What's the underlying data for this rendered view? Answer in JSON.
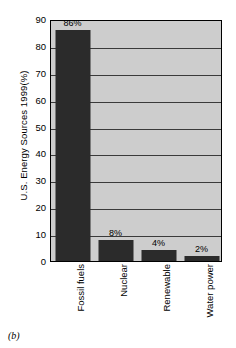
{
  "caption": "(b)",
  "chart_data": {
    "type": "bar",
    "title": "",
    "xlabel": "",
    "ylabel": "U.S. Energy Sources 1999(%)",
    "categories": [
      "Fossil fuels",
      "Nuclear",
      "Renewable",
      "Water power"
    ],
    "values": [
      86,
      8,
      4,
      2
    ],
    "data_labels": [
      "86%",
      "8%",
      "4%",
      "2%"
    ],
    "ylim": [
      0,
      90
    ],
    "yticks": [
      0,
      10,
      20,
      30,
      40,
      50,
      60,
      70,
      80,
      90
    ],
    "ytick_labels": [
      "0",
      "10",
      "20",
      "30",
      "40",
      "50",
      "60",
      "70",
      "80",
      "90"
    ],
    "grid": true,
    "legend": false,
    "colors": {
      "bar": "#2b2b2b",
      "plot_background": "#cdcdcd",
      "axis": "#000000",
      "gridline": "#3a3a3a",
      "figure_background": "#ffffff",
      "text": "#000000"
    }
  }
}
